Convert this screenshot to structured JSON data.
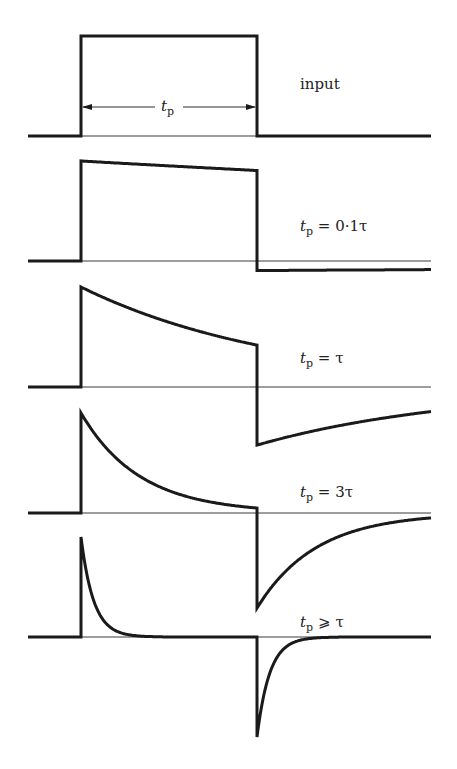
{
  "geometry": {
    "x_start": 28,
    "x_rise": 81,
    "x_fall": 257,
    "x_end": 431,
    "amplitude": 100,
    "tau_px": 176
  },
  "panels": [
    {
      "id": "input",
      "label_main": "input",
      "label_t": "",
      "label_sub": "",
      "label_rel": "",
      "baseline_y": 136,
      "tp_over_tau": 0,
      "label_x": 300,
      "label_y": 89,
      "show_arrow": true
    },
    {
      "id": "tp-0.1tau",
      "label_main": "",
      "label_t": "t",
      "label_sub": "p",
      "label_rel": " = 0·1τ",
      "baseline_y": 261,
      "tp_over_tau": 0.1,
      "label_x": 300,
      "label_y": 231,
      "show_arrow": false
    },
    {
      "id": "tp-tau",
      "label_main": "",
      "label_t": "t",
      "label_sub": "p",
      "label_rel": " = τ",
      "baseline_y": 387,
      "tp_over_tau": 0.87,
      "label_x": 300,
      "label_y": 363,
      "show_arrow": false
    },
    {
      "id": "tp-3tau",
      "label_main": "",
      "label_t": "t",
      "label_sub": "p",
      "label_rel": " = 3τ",
      "baseline_y": 513,
      "tp_over_tau": 3,
      "label_x": 300,
      "label_y": 497,
      "show_arrow": false
    },
    {
      "id": "tp-much-greater-tau",
      "label_main": "",
      "label_t": "t",
      "label_sub": "p",
      "label_rel": " ⩾ τ",
      "baseline_y": 637,
      "tp_over_tau": 14,
      "label_x": 300,
      "label_y": 627,
      "show_arrow": false
    }
  ],
  "arrow": {
    "label_t": "t",
    "label_sub": "p",
    "y": 107
  },
  "colors": {
    "stroke": "#1a1a1a",
    "background": "#ffffff"
  }
}
